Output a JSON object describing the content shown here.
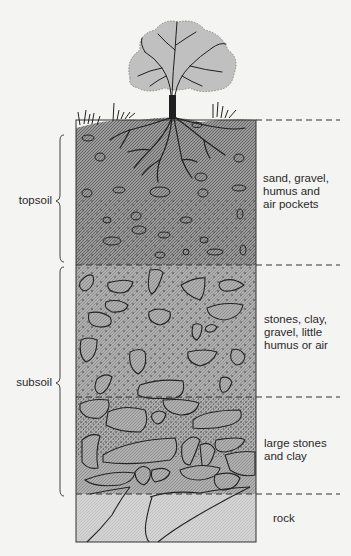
{
  "diagram": {
    "colors": {
      "background": "#f4f4f2",
      "topsoil": "#8f8f8f",
      "subsoil": "#a8a8a8",
      "large_stones": "#b8b8b8",
      "rock": "#d2d2d2",
      "outline": "#2b2b2b"
    },
    "brackets": [
      {
        "id": "topsoil",
        "label": "topsoil"
      },
      {
        "id": "subsoil",
        "label": "subsoil"
      }
    ],
    "layers": [
      {
        "id": "layer1",
        "description": "sand, gravel, humus and air pockets",
        "lines": [
          "sand, gravel,",
          "humus and",
          "air pockets"
        ]
      },
      {
        "id": "layer2",
        "description": "stones, clay, gravel, little humus or air",
        "lines": [
          "stones, clay,",
          "gravel, little",
          "humus or air"
        ]
      },
      {
        "id": "layer3",
        "description": "large stones and clay",
        "lines": [
          "large stones",
          "and clay"
        ]
      },
      {
        "id": "layer4",
        "description": "rock",
        "lines": [
          "rock"
        ]
      }
    ],
    "illustration": {
      "tree": "tree-icon",
      "grass": "grass-icon",
      "roots": "roots-icon"
    }
  }
}
